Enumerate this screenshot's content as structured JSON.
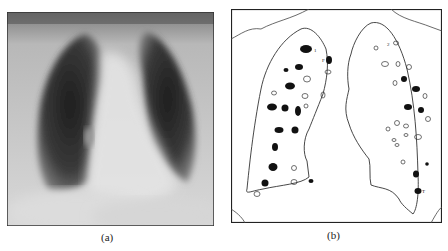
{
  "figure": {
    "panels": [
      {
        "id": "a",
        "caption": "(a)",
        "content": "chest-xray",
        "description": "Frontal chest radiograph"
      },
      {
        "id": "b",
        "caption": "(b)",
        "content": "lung-nodule-diagram",
        "description": "Outline drawing of both lungs with filled (black) and open (white) nodule markers"
      }
    ],
    "annotations": [
      "1",
      "F",
      "2",
      "T"
    ],
    "colors": {
      "ink": "#1a1a1a",
      "paper": "#ffffff",
      "xray_dark": "#2a2a2a",
      "xray_light": "#e6e6e6"
    }
  }
}
